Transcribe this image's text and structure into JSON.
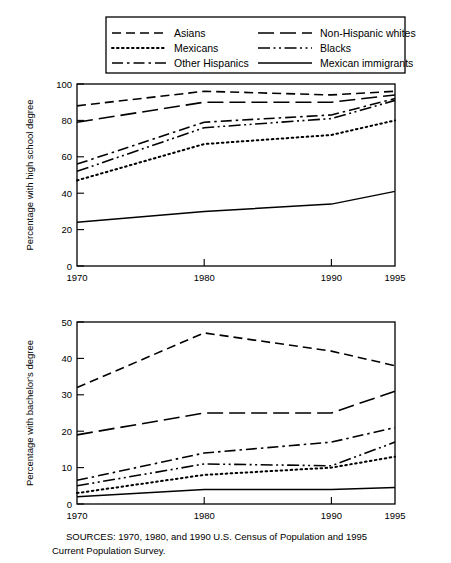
{
  "figure": {
    "source_note_line1": "SOURCES:  1970, 1980, and 1990 U.S. Census of Population and 1995",
    "source_note_line2": "Current Population Survey."
  },
  "legend": {
    "position": "top",
    "entries": [
      {
        "label": "Asians",
        "dash": "dashed",
        "column": 0
      },
      {
        "label": "Mexicans",
        "dash": "dotted",
        "column": 0
      },
      {
        "label": "Other Hispanics",
        "dash": "dash-dot",
        "column": 0
      },
      {
        "label": "Non-Hispanic whites",
        "dash": "long-dash",
        "column": 1
      },
      {
        "label": "Blacks",
        "dash": "dash-dot-dot",
        "column": 1
      },
      {
        "label": "Mexican immigrants",
        "dash": "solid",
        "column": 1
      }
    ]
  },
  "chart_data": [
    {
      "id": "high-school",
      "type": "line",
      "title": "",
      "xlabel": "",
      "ylabel": "Percentage with high school degree",
      "x": [
        1970,
        1980,
        1990,
        1995
      ],
      "categories": [
        "1970",
        "1980",
        "1990",
        "1995"
      ],
      "xticks": [
        1970,
        1980,
        1990,
        1995
      ],
      "xticklabels": [
        "1970",
        "1980",
        "1990",
        "1995"
      ],
      "xlim": [
        1970,
        1995
      ],
      "ylim": [
        0,
        100
      ],
      "yticks": [
        0,
        20,
        40,
        60,
        80,
        100
      ],
      "yticklabels": [
        "0",
        "20",
        "40",
        "60",
        "80",
        "100"
      ],
      "grid": false,
      "series": [
        {
          "name": "Asians",
          "dash": "dashed",
          "values": [
            88,
            96,
            94,
            96
          ]
        },
        {
          "name": "Mexicans",
          "dash": "dotted",
          "values": [
            47,
            67,
            72,
            80
          ]
        },
        {
          "name": "Other Hispanics",
          "dash": "dash-dot",
          "values": [
            56,
            79,
            83,
            92
          ]
        },
        {
          "name": "Non-Hispanic whites",
          "dash": "long-dash",
          "values": [
            79,
            90,
            90,
            94
          ]
        },
        {
          "name": "Blacks",
          "dash": "dash-dot-dot",
          "values": [
            52,
            76,
            81,
            91
          ]
        },
        {
          "name": "Mexican immigrants",
          "dash": "solid",
          "values": [
            24,
            30,
            34,
            41
          ]
        }
      ]
    },
    {
      "id": "bachelors",
      "type": "line",
      "title": "",
      "xlabel": "",
      "ylabel": "Percentage with bachelor's degree",
      "x": [
        1970,
        1980,
        1990,
        1995
      ],
      "categories": [
        "1970",
        "1980",
        "1990",
        "1995"
      ],
      "xticks": [
        1970,
        1980,
        1990,
        1995
      ],
      "xticklabels": [
        "1970",
        "1980",
        "1990",
        "1995"
      ],
      "xlim": [
        1970,
        1995
      ],
      "ylim": [
        0,
        50
      ],
      "yticks": [
        0,
        10,
        20,
        30,
        40,
        50
      ],
      "yticklabels": [
        "0",
        "10",
        "20",
        "30",
        "40",
        "50"
      ],
      "grid": false,
      "series": [
        {
          "name": "Asians",
          "dash": "dashed",
          "values": [
            32,
            47,
            42,
            38
          ]
        },
        {
          "name": "Mexicans",
          "dash": "dotted",
          "values": [
            3,
            8,
            10,
            13
          ]
        },
        {
          "name": "Other Hispanics",
          "dash": "dash-dot",
          "values": [
            6.5,
            14,
            17,
            21
          ]
        },
        {
          "name": "Non-Hispanic whites",
          "dash": "long-dash",
          "values": [
            19,
            25,
            25,
            31
          ]
        },
        {
          "name": "Blacks",
          "dash": "dash-dot-dot",
          "values": [
            5,
            11,
            10.5,
            17
          ]
        },
        {
          "name": "Mexican immigrants",
          "dash": "solid",
          "values": [
            2,
            4,
            4,
            4.5
          ]
        }
      ]
    }
  ],
  "colors": {
    "ink": "#000000",
    "background": "#ffffff"
  }
}
